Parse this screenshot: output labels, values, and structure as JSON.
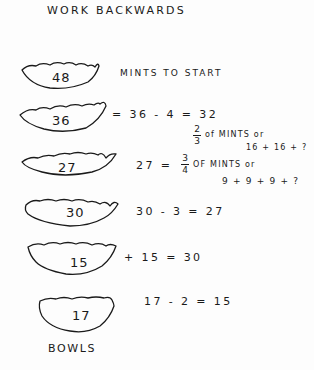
{
  "title": "WORK BACKWARDS",
  "ink_color": "#1a1a1a",
  "bowls": [
    {
      "count": "48",
      "note": "MINTS TO START"
    },
    {
      "count": "36",
      "equation": "= 36 - 4 = 32",
      "fraction": {
        "num": "2",
        "den": "3"
      },
      "fraction_note": "of MINTS or",
      "sum_note": "16 + 16 + ?"
    },
    {
      "count": "27",
      "equation_prefix": "27 =",
      "fraction": {
        "num": "3",
        "den": "4"
      },
      "fraction_note": "OF MINTS or",
      "sum_note": "9 + 9 + 9 + ?"
    },
    {
      "count": "30",
      "equation": "30 - 3 = 27"
    },
    {
      "count": "15",
      "equation": "+ 15 = 30"
    },
    {
      "count": "17",
      "equation": "17 - 2 = 15"
    }
  ],
  "footer_label": "BOWLS"
}
